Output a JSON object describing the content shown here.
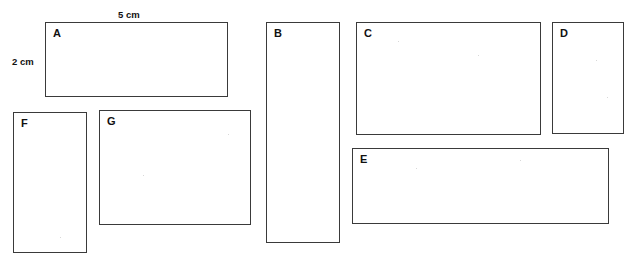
{
  "figure": {
    "title": "",
    "type": "geometry-rectangles-diagram",
    "background_color": "#ffffff",
    "stroke_color": "#3a3a3a",
    "label_color": "#111111",
    "width_px": 631,
    "height_px": 263
  },
  "dimension_labels": [
    {
      "id": "width-label",
      "text": "5 cm",
      "describes": "A",
      "edge": "top",
      "x": 118,
      "y": 10
    },
    {
      "id": "height-label",
      "text": "2 cm",
      "describes": "A",
      "edge": "left",
      "x": 12,
      "y": 57
    }
  ],
  "rectangles": [
    {
      "id": "A",
      "label": "A",
      "x": 45,
      "y": 22,
      "width": 183,
      "height": 75
    },
    {
      "id": "B",
      "label": "B",
      "x": 266,
      "y": 22,
      "width": 74,
      "height": 221
    },
    {
      "id": "C",
      "label": "C",
      "x": 356,
      "y": 22,
      "width": 185,
      "height": 113
    },
    {
      "id": "D",
      "label": "D",
      "x": 552,
      "y": 22,
      "width": 72,
      "height": 112
    },
    {
      "id": "E",
      "label": "E",
      "x": 352,
      "y": 148,
      "width": 257,
      "height": 76
    },
    {
      "id": "F",
      "label": "F",
      "x": 13,
      "y": 112,
      "width": 74,
      "height": 141
    },
    {
      "id": "G",
      "label": "G",
      "x": 99,
      "y": 110,
      "width": 152,
      "height": 115
    }
  ],
  "specks": [
    {
      "x": 143,
      "y": 175
    },
    {
      "x": 416,
      "y": 168
    },
    {
      "x": 398,
      "y": 41
    },
    {
      "x": 607,
      "y": 97
    },
    {
      "x": 596,
      "y": 60
    },
    {
      "x": 520,
      "y": 160
    },
    {
      "x": 228,
      "y": 134
    },
    {
      "x": 60,
      "y": 237
    },
    {
      "x": 478,
      "y": 55
    }
  ]
}
